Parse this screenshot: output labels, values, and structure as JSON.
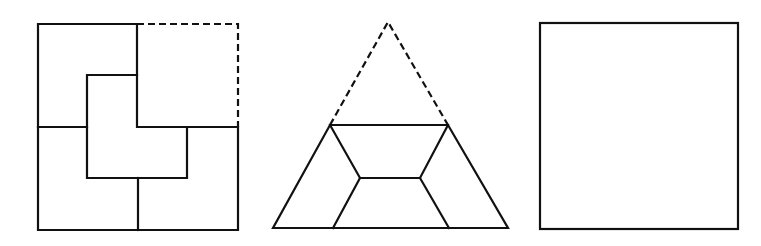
{
  "diagram": {
    "type": "geometric dissection puzzle",
    "stroke_color": "#111111",
    "background": "#ffffff",
    "figures": [
      {
        "name": "square-with-L-pieces",
        "description": "Square (one quadrant dashed) divided into four pieces around a central L-shape",
        "outer": {
          "x1": 38,
          "y1": 24,
          "x2": 238,
          "y2": 230
        },
        "dashed_quadrant": "top-right",
        "solid_segments": [
          [
            [
              137,
              24
            ],
            [
              38,
              24
            ],
            [
              38,
              230
            ],
            [
              238,
              230
            ],
            [
              238,
              127
            ],
            [
              137,
              127
            ],
            [
              137,
              24
            ]
          ],
          [
            [
              38,
              127
            ],
            [
              87,
              127
            ]
          ],
          [
            [
              137,
              75
            ],
            [
              87,
              75
            ],
            [
              87,
              178
            ],
            [
              187,
              178
            ],
            [
              187,
              127
            ]
          ],
          [
            [
              138,
              178
            ],
            [
              138,
              230
            ]
          ]
        ],
        "dashed_segments": [
          [
            [
              137,
              24
            ],
            [
              238,
              24
            ],
            [
              238,
              127
            ]
          ]
        ]
      },
      {
        "name": "triangle-trapezoid-dissection",
        "description": "Triangle with dashed top section; lower trapezoid divided into pieces with inner hexagon",
        "apex": [
          388,
          22
        ],
        "solid_segments": [
          [
            [
              330,
              125
            ],
            [
              448,
              125
            ],
            [
              508,
              228
            ],
            [
              273,
              228
            ],
            [
              330,
              125
            ]
          ],
          [
            [
              330,
              125
            ],
            [
              360,
              178
            ],
            [
              420,
              178
            ],
            [
              448,
              125
            ]
          ],
          [
            [
              360,
              178
            ],
            [
              333,
              228
            ]
          ],
          [
            [
              420,
              178
            ],
            [
              449,
              228
            ]
          ]
        ],
        "dashed_segments": [
          [
            [
              330,
              125
            ],
            [
              388,
              22
            ],
            [
              448,
              125
            ]
          ]
        ]
      },
      {
        "name": "empty-square",
        "description": "Plain square outline",
        "outer": {
          "x1": 540,
          "y1": 23,
          "x2": 738,
          "y2": 229
        }
      }
    ]
  }
}
